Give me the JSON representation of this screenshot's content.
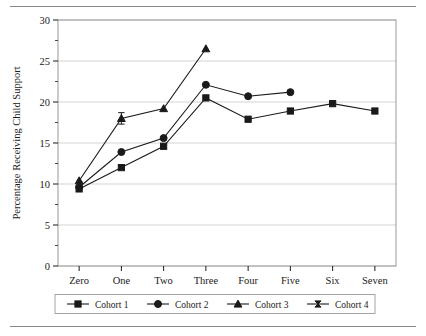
{
  "figure": {
    "top_rule": "horizontal-rule",
    "bottom_rule": "horizontal-rule"
  },
  "chart_data": {
    "type": "line",
    "title": "",
    "xlabel": "Child's Age",
    "ylabel": "Percentage Receiving Child Support",
    "categories": [
      "Zero",
      "One",
      "Two",
      "Three",
      "Four",
      "Five",
      "Six",
      "Seven"
    ],
    "ylim": [
      0,
      30
    ],
    "yticks": [
      0,
      5,
      10,
      15,
      20,
      25,
      30
    ],
    "ytick_labels": [
      "0",
      "5",
      "10",
      "15",
      "20",
      "25",
      "30"
    ],
    "yminor_ticks": [
      2.5,
      7.5,
      12.5,
      17.5,
      22.5,
      27.5
    ],
    "grid": "horizontal",
    "legend_position": "below-axis",
    "series": [
      {
        "name": "Cohort 1",
        "marker": "square",
        "x": [
          "Zero",
          "One",
          "Two",
          "Three",
          "Four",
          "Five",
          "Six",
          "Seven"
        ],
        "values": [
          9.4,
          12.0,
          14.6,
          20.5,
          17.9,
          18.9,
          19.8,
          18.9
        ]
      },
      {
        "name": "Cohort 2",
        "marker": "circle",
        "x": [
          "Zero",
          "One",
          "Two",
          "Three",
          "Four",
          "Five"
        ],
        "values": [
          9.6,
          13.9,
          15.6,
          22.1,
          20.7,
          21.2
        ]
      },
      {
        "name": "Cohort 3",
        "marker": "triangle",
        "x": [
          "Zero",
          "One",
          "Two",
          "Three"
        ],
        "values": [
          10.4,
          18.0,
          19.2,
          26.5
        ],
        "error_bars": [
          0.0,
          0.7,
          0.0,
          0.0
        ]
      },
      {
        "name": "Cohort 4",
        "marker": "bowtie",
        "x": [
          "Zero"
        ],
        "values": [
          9.9
        ]
      }
    ]
  },
  "legend": {
    "entries": [
      {
        "label": "Cohort 1",
        "marker": "square"
      },
      {
        "label": "Cohort 2",
        "marker": "circle"
      },
      {
        "label": "Cohort 3",
        "marker": "triangle"
      },
      {
        "label": "Cohort 4",
        "marker": "bowtie"
      }
    ]
  },
  "colors": {
    "line": "#1a1a1a",
    "grid": "#c8c8c8",
    "frame": "#9a9a9a",
    "rule": "#8a8a8a",
    "text": "#1a1a1a"
  }
}
